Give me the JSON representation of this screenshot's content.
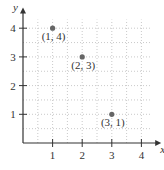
{
  "chart_data": {
    "type": "scatter",
    "title": "",
    "xlabel": "x",
    "ylabel": "y",
    "xlim": [
      0,
      4.3
    ],
    "ylim": [
      0,
      4.3
    ],
    "grid": true,
    "grid_style": "dotted, half-unit spacing",
    "x_ticks": [
      "1",
      "2",
      "3",
      "4"
    ],
    "y_ticks": [
      "1",
      "2",
      "3",
      "4"
    ],
    "points": [
      {
        "x": 1,
        "y": 4,
        "label": "(1, 4)"
      },
      {
        "x": 2,
        "y": 3,
        "label": "(2, 3)"
      },
      {
        "x": 3,
        "y": 1,
        "label": "(3, 1)"
      }
    ],
    "legend": null,
    "colors": {
      "axis": "#333333",
      "grid": "#bbbbbb",
      "point": "#666666"
    }
  }
}
